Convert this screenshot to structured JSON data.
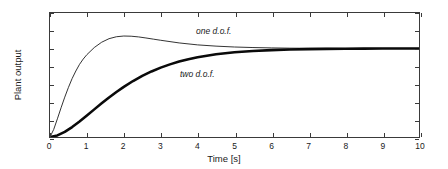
{
  "chart_data": {
    "type": "line",
    "title": "",
    "xlabel": "Time [s]",
    "ylabel": "Plant output",
    "xlim": [
      0,
      10
    ],
    "ylim": [
      0,
      1.4
    ],
    "xticks": [
      "0",
      "1",
      "2",
      "3",
      "4",
      "5",
      "6",
      "7",
      "8",
      "9",
      "10"
    ],
    "yticks": [
      "0",
      "0.2",
      "0.4",
      "0.6",
      "0.8",
      "1",
      "1.2",
      "1.4"
    ],
    "grid": false,
    "legend_position": "inline-annotations",
    "series": [
      {
        "name": "one d.o.f.",
        "style": "thin",
        "color": "#1a1a1a",
        "linewidth": 0.9,
        "annotation": "one d.o.f.",
        "annotation_xy": [
          5.0,
          1.24
        ],
        "x": [
          0,
          0.1,
          0.2,
          0.3,
          0.4,
          0.5,
          0.6,
          0.7,
          0.8,
          0.9,
          1.0,
          1.2,
          1.4,
          1.6,
          1.8,
          2.0,
          2.2,
          2.4,
          2.6,
          2.8,
          3.0,
          3.5,
          4.0,
          4.5,
          5.0,
          5.5,
          6.0,
          6.5,
          7.0,
          7.5,
          8.0,
          8.5,
          9.0,
          9.5,
          10.0
        ],
        "y": [
          0,
          0.085,
          0.205,
          0.33,
          0.45,
          0.56,
          0.66,
          0.745,
          0.82,
          0.88,
          0.93,
          1.01,
          1.07,
          1.11,
          1.132,
          1.14,
          1.138,
          1.13,
          1.118,
          1.105,
          1.092,
          1.062,
          1.04,
          1.026,
          1.016,
          1.01,
          1.006,
          1.003,
          1.002,
          1.001,
          1.0,
          1.0,
          1.0,
          1.0,
          1.0
        ]
      },
      {
        "name": "two d.o.f.",
        "style": "thick",
        "color": "#0a0a0a",
        "linewidth": 2.6,
        "annotation": "two d.o.f.",
        "annotation_xy": [
          4.3,
          0.69
        ],
        "x": [
          0,
          0.2,
          0.4,
          0.6,
          0.8,
          1.0,
          1.2,
          1.4,
          1.6,
          1.8,
          2.0,
          2.25,
          2.5,
          2.75,
          3.0,
          3.25,
          3.5,
          3.75,
          4.0,
          4.5,
          5.0,
          5.5,
          6.0,
          6.5,
          7.0,
          7.5,
          8.0,
          8.5,
          9.0,
          9.5,
          10.0
        ],
        "y": [
          0,
          0.018,
          0.058,
          0.112,
          0.175,
          0.242,
          0.312,
          0.38,
          0.446,
          0.508,
          0.566,
          0.632,
          0.69,
          0.74,
          0.783,
          0.82,
          0.852,
          0.879,
          0.901,
          0.934,
          0.956,
          0.971,
          0.981,
          0.988,
          0.992,
          0.995,
          0.997,
          0.998,
          0.999,
          0.999,
          1.0
        ]
      }
    ]
  }
}
